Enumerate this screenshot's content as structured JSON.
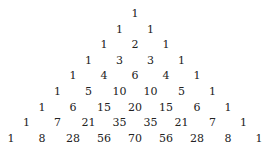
{
  "rows": [
    [
      1
    ],
    [
      1,
      1
    ],
    [
      1,
      2,
      1
    ],
    [
      1,
      3,
      3,
      1
    ],
    [
      1,
      4,
      6,
      4,
      1
    ],
    [
      1,
      5,
      10,
      10,
      5,
      1
    ],
    [
      1,
      6,
      15,
      20,
      15,
      6,
      1
    ],
    [
      1,
      7,
      21,
      35,
      35,
      21,
      7,
      1
    ],
    [
      1,
      8,
      28,
      56,
      70,
      56,
      28,
      8,
      1
    ]
  ]
}
